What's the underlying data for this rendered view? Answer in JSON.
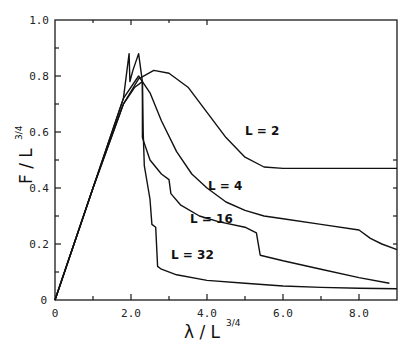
{
  "chart_data": {
    "type": "line",
    "title": "",
    "xlabel": "λ / L^3/4",
    "ylabel": "F / L^3/4",
    "xlim": [
      0,
      9
    ],
    "ylim": [
      0,
      1.0
    ],
    "grid": false,
    "legend": "inline curve labels",
    "x_ticks": [
      "0",
      "2.0",
      "4.0",
      "6.0",
      "8.0"
    ],
    "y_ticks": [
      "0",
      "0.2",
      "0.4",
      "0.6",
      "0.8",
      "1.0"
    ],
    "series": [
      {
        "name": "L = 2",
        "x": [
          0,
          1.0,
          1.8,
          2.2,
          2.6,
          3.0,
          3.5,
          4.0,
          4.5,
          5.0,
          5.5,
          6.0,
          7.0,
          8.0,
          9.0
        ],
        "y": [
          0,
          0.4,
          0.7,
          0.79,
          0.82,
          0.81,
          0.76,
          0.67,
          0.58,
          0.51,
          0.475,
          0.47,
          0.47,
          0.47,
          0.47
        ]
      },
      {
        "name": "L = 4",
        "x": [
          0,
          1.0,
          1.8,
          2.1,
          2.3,
          2.5,
          2.8,
          3.2,
          3.6,
          4.0,
          4.5,
          5.0,
          5.5,
          6.0,
          7.0,
          8.0,
          8.3,
          8.6,
          9.0
        ],
        "y": [
          0,
          0.4,
          0.7,
          0.76,
          0.78,
          0.74,
          0.64,
          0.53,
          0.45,
          0.4,
          0.35,
          0.32,
          0.3,
          0.29,
          0.27,
          0.25,
          0.22,
          0.2,
          0.18
        ]
      },
      {
        "name": "L = 16",
        "x": [
          0,
          1.0,
          1.8,
          2.2,
          2.3,
          2.3,
          2.5,
          2.8,
          3.0,
          3.05,
          3.3,
          3.8,
          4.3,
          5.0,
          5.3,
          5.4,
          6.0,
          7.0,
          8.0,
          8.8
        ],
        "y": [
          0,
          0.4,
          0.72,
          0.8,
          0.78,
          0.58,
          0.5,
          0.45,
          0.43,
          0.38,
          0.34,
          0.3,
          0.28,
          0.26,
          0.24,
          0.16,
          0.14,
          0.11,
          0.08,
          0.06
        ]
      },
      {
        "name": "L = 32",
        "x": [
          0,
          1.0,
          1.8,
          1.95,
          1.97,
          2.05,
          2.2,
          2.3,
          2.32,
          2.35,
          2.45,
          2.5,
          2.55,
          2.65,
          2.7,
          2.8,
          3.2,
          4.0,
          5.0,
          6.0,
          7.0,
          8.0,
          9.0
        ],
        "y": [
          0,
          0.4,
          0.72,
          0.88,
          0.78,
          0.82,
          0.88,
          0.78,
          0.6,
          0.48,
          0.4,
          0.36,
          0.27,
          0.26,
          0.12,
          0.11,
          0.09,
          0.07,
          0.06,
          0.05,
          0.045,
          0.042,
          0.04
        ]
      }
    ],
    "annotations": [
      {
        "text": "L = 2",
        "x": 5.0,
        "y": 0.59
      },
      {
        "text": "L = 4",
        "x": 4.1,
        "y": 0.39
      },
      {
        "text": "L = 16",
        "x": 3.4,
        "y": 0.27
      },
      {
        "text": "L = 32",
        "x": 3.0,
        "y": 0.16
      }
    ]
  },
  "axes": {
    "x_label_main": "λ / L",
    "x_label_sup": "3/4",
    "y_label_main": "F / L",
    "y_label_sup": "3/4"
  },
  "labels": {
    "l2": "L = 2",
    "l4": "L = 4",
    "l16": "L = 16",
    "l32": "L = 32"
  },
  "ticks": {
    "x": [
      "0",
      "2.0",
      "4.0",
      "6.0",
      "8.0"
    ],
    "y": [
      "0",
      "0.2",
      "0.4",
      "0.6",
      "0.8",
      "1.0"
    ]
  }
}
